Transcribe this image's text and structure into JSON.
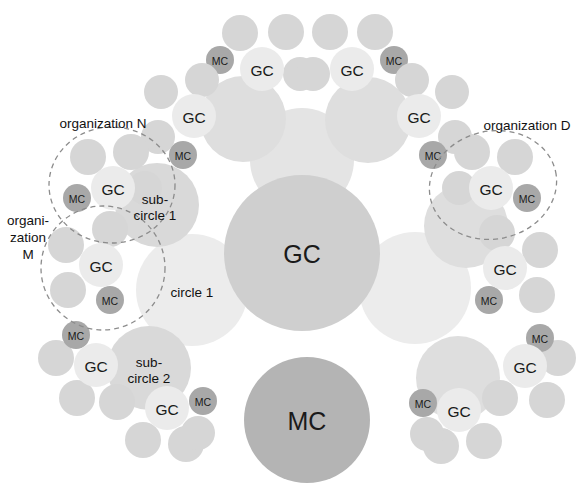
{
  "diagram": {
    "background": "#ffffff",
    "width": 584,
    "height": 495,
    "colors": {
      "core_gc": "#cfcfcf",
      "core_mc": "#b4b4b4",
      "super_circle": "#e3e3e3",
      "sub_circle": "#d9d9d9",
      "circle_light": "#ececec",
      "role_circle": "#d6d6d6",
      "gc_small": "#ebebeb",
      "mc_small": "#a8a8a8",
      "dashed_stroke": "#8c8c8c",
      "text": "#1a1a1a"
    },
    "labels": {
      "gc": "GC",
      "mc": "MC",
      "organization_n": "organization N",
      "organization_m_line1": "organi-",
      "organization_m_line2": "zation",
      "organization_m_line3": "M",
      "organization_d": "organization D",
      "circle_1": "circle 1",
      "sub_circle_1_line1": "sub-",
      "sub_circle_1_line2": "circle 1",
      "sub_circle_2_line1": "sub-",
      "sub_circle_2_line2": "circle 2"
    },
    "center_nodes": [
      {
        "id": "center-gc",
        "label": "GC",
        "cx": 302,
        "cy": 253,
        "r": 78,
        "fill": "#cfcfcf",
        "size": "big"
      },
      {
        "id": "center-mc",
        "label": "MC",
        "cx": 307,
        "cy": 420,
        "r": 63,
        "fill": "#b4b4b4",
        "size": "big"
      }
    ],
    "plain_circles": [
      {
        "id": "circle-1",
        "label": "circle 1",
        "cx": 192,
        "cy": 290,
        "r": 56,
        "fill": "#ececec"
      },
      {
        "id": "circle-right",
        "label": "",
        "cx": 415,
        "cy": 288,
        "r": 56,
        "fill": "#ececec"
      },
      {
        "id": "circle-top",
        "label": "",
        "cx": 302,
        "cy": 160,
        "r": 52,
        "fill": "#e4e4e4"
      },
      {
        "id": "sub-circle-1",
        "label": "sub-circle 1",
        "cx": 157,
        "cy": 205,
        "r": 42,
        "fill": "#d9d9d9"
      },
      {
        "id": "sub-circle-2",
        "label": "sub-circle 2",
        "cx": 149,
        "cy": 368,
        "r": 42,
        "fill": "#d9d9d9"
      },
      {
        "id": "sub-upper-left",
        "label": "",
        "cx": 243,
        "cy": 119,
        "r": 43,
        "fill": "#dedede"
      },
      {
        "id": "sub-upper-right",
        "label": "",
        "cx": 368,
        "cy": 120,
        "r": 43,
        "fill": "#dedede"
      },
      {
        "id": "sub-mid-right",
        "label": "",
        "cx": 466,
        "cy": 226,
        "r": 42,
        "fill": "#dedede"
      },
      {
        "id": "sub-low-right",
        "label": "",
        "cx": 458,
        "cy": 378,
        "r": 42,
        "fill": "#dedede"
      }
    ],
    "gc_clusters": [
      {
        "id": "gc-top-left",
        "cx": 262,
        "cy": 69,
        "r": 22,
        "mc": {
          "cx": 220,
          "cy": 60,
          "r": 14
        },
        "satellites": [
          {
            "cx": 240,
            "cy": 33,
            "r": 18
          },
          {
            "cx": 286,
            "cy": 32,
            "r": 18
          },
          {
            "cx": 300,
            "cy": 74,
            "r": 17
          }
        ]
      },
      {
        "id": "gc-top-right",
        "cx": 352,
        "cy": 69,
        "r": 22,
        "mc": {
          "cx": 394,
          "cy": 60,
          "r": 14
        },
        "satellites": [
          {
            "cx": 330,
            "cy": 32,
            "r": 18
          },
          {
            "cx": 375,
            "cy": 32,
            "r": 18
          },
          {
            "cx": 313,
            "cy": 74,
            "r": 17
          }
        ]
      },
      {
        "id": "gc-upper-left",
        "cx": 194,
        "cy": 116,
        "r": 22,
        "mc": {
          "cx": 183,
          "cy": 155,
          "r": 14
        },
        "satellites": [
          {
            "cx": 161,
            "cy": 92,
            "r": 17
          },
          {
            "cx": 202,
            "cy": 80,
            "r": 17
          },
          {
            "cx": 158,
            "cy": 137,
            "r": 17
          }
        ]
      },
      {
        "id": "gc-upper-right",
        "cx": 419,
        "cy": 116,
        "r": 22,
        "mc": {
          "cx": 433,
          "cy": 155,
          "r": 14
        },
        "satellites": [
          {
            "cx": 452,
            "cy": 92,
            "r": 17
          },
          {
            "cx": 412,
            "cy": 80,
            "r": 17
          },
          {
            "cx": 455,
            "cy": 137,
            "r": 17
          }
        ]
      },
      {
        "id": "gc-org-n",
        "cx": 113,
        "cy": 188,
        "r": 22,
        "mc": {
          "cx": 77,
          "cy": 198,
          "r": 14
        },
        "satellites": [
          {
            "cx": 88,
            "cy": 157,
            "r": 18
          },
          {
            "cx": 131,
            "cy": 152,
            "r": 18
          },
          {
            "cx": 145,
            "cy": 188,
            "r": 17
          }
        ]
      },
      {
        "id": "gc-org-d",
        "cx": 491,
        "cy": 188,
        "r": 22,
        "mc": {
          "cx": 527,
          "cy": 198,
          "r": 14
        },
        "satellites": [
          {
            "cx": 515,
            "cy": 157,
            "r": 18
          },
          {
            "cx": 472,
            "cy": 152,
            "r": 18
          },
          {
            "cx": 459,
            "cy": 188,
            "r": 17
          }
        ]
      },
      {
        "id": "gc-org-m",
        "cx": 101,
        "cy": 265,
        "r": 22,
        "mc": {
          "cx": 110,
          "cy": 300,
          "r": 14
        },
        "satellites": [
          {
            "cx": 66,
            "cy": 245,
            "r": 18
          },
          {
            "cx": 110,
            "cy": 229,
            "r": 18
          },
          {
            "cx": 68,
            "cy": 290,
            "r": 18
          }
        ]
      },
      {
        "id": "gc-mid-right",
        "cx": 505,
        "cy": 268,
        "r": 22,
        "mc": {
          "cx": 489,
          "cy": 300,
          "r": 14
        },
        "satellites": [
          {
            "cx": 540,
            "cy": 250,
            "r": 18
          },
          {
            "cx": 497,
            "cy": 233,
            "r": 18
          },
          {
            "cx": 537,
            "cy": 295,
            "r": 18
          }
        ]
      },
      {
        "id": "gc-low-left",
        "cx": 96,
        "cy": 365,
        "r": 22,
        "mc": {
          "cx": 76,
          "cy": 335,
          "r": 14
        },
        "satellites": [
          {
            "cx": 56,
            "cy": 358,
            "r": 18
          },
          {
            "cx": 77,
            "cy": 398,
            "r": 18
          },
          {
            "cx": 117,
            "cy": 402,
            "r": 18
          }
        ]
      },
      {
        "id": "gc-low-right",
        "cx": 525,
        "cy": 366,
        "r": 22,
        "mc": {
          "cx": 540,
          "cy": 338,
          "r": 14
        },
        "satellites": [
          {
            "cx": 558,
            "cy": 358,
            "r": 18
          },
          {
            "cx": 547,
            "cy": 400,
            "r": 18
          },
          {
            "cx": 500,
            "cy": 398,
            "r": 18
          }
        ]
      },
      {
        "id": "gc-bottom-left",
        "cx": 167,
        "cy": 408,
        "r": 22,
        "mc": {
          "cx": 203,
          "cy": 401,
          "r": 14
        },
        "satellites": [
          {
            "cx": 143,
            "cy": 440,
            "r": 18
          },
          {
            "cx": 186,
            "cy": 444,
            "r": 18
          },
          {
            "cx": 198,
            "cy": 433,
            "r": 17
          }
        ]
      },
      {
        "id": "gc-bottom-right",
        "cx": 459,
        "cy": 410,
        "r": 22,
        "mc": {
          "cx": 423,
          "cy": 403,
          "r": 14
        },
        "satellites": [
          {
            "cx": 484,
            "cy": 441,
            "r": 18
          },
          {
            "cx": 441,
            "cy": 446,
            "r": 18
          },
          {
            "cx": 427,
            "cy": 434,
            "r": 17
          }
        ]
      }
    ],
    "dashed_orgs": [
      {
        "id": "org-n",
        "label": "organization N",
        "cx": 112,
        "cy": 185,
        "rx": 63,
        "ry": 58,
        "rotate": 0,
        "label_x": 103,
        "label_y": 123
      },
      {
        "id": "org-m",
        "label": "organization M",
        "cx": 103,
        "cy": 268,
        "rx": 62,
        "ry": 62,
        "rotate": 0,
        "label_x": 28,
        "label_y": 220
      },
      {
        "id": "org-d",
        "label": "organization D",
        "cx": 493,
        "cy": 185,
        "rx": 64,
        "ry": 54,
        "rotate": -12,
        "label_x": 527,
        "label_y": 125
      }
    ]
  }
}
